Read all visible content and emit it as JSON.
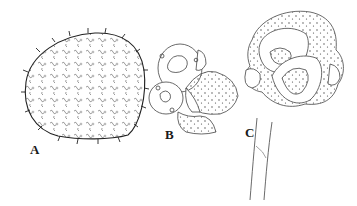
{
  "figure": {
    "panels": [
      {
        "label": "A",
        "description": "spiny globose spore with reticulate ornamentation"
      },
      {
        "label": "B",
        "description": "cluster of cells / spore ball"
      },
      {
        "label": "C",
        "description": "spore cluster on stalk"
      }
    ],
    "colors": {
      "ink": "#333333",
      "background": "#ffffff"
    }
  }
}
